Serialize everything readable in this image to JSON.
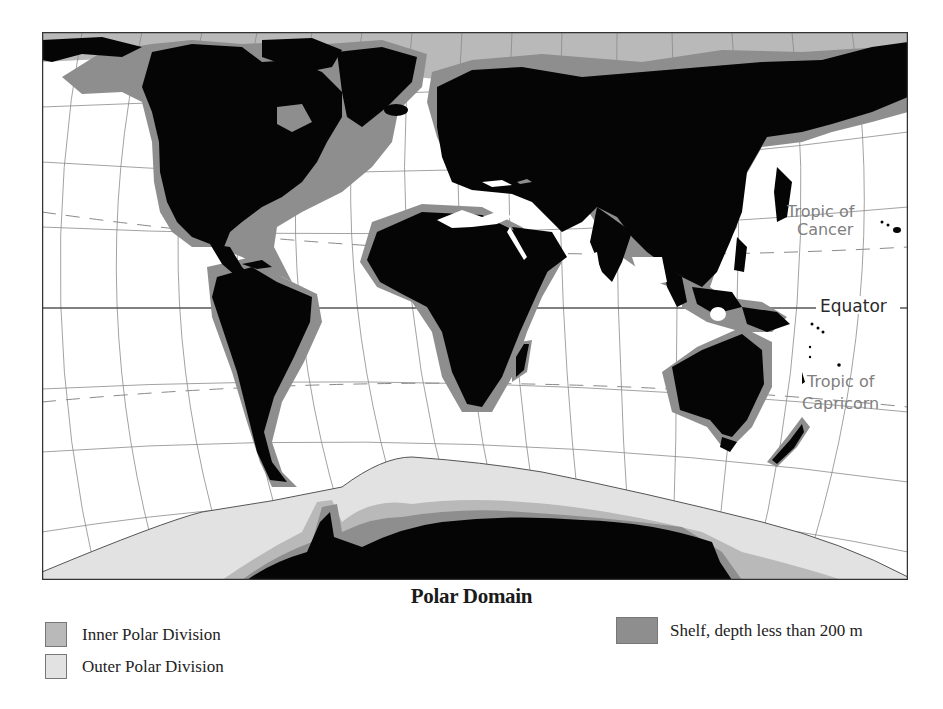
{
  "title": "Polar Domain",
  "map": {
    "labels": {
      "tropic_cancer_line1": "Tropic of",
      "tropic_cancer_line2": "Cancer",
      "equator": "Equator",
      "tropic_capricorn_line1": "Tropic of",
      "tropic_capricorn_line2": "Capricorn"
    },
    "colors": {
      "land": "#050505",
      "shelf": "#8e8e8e",
      "inner_polar": "#b9b9b9",
      "outer_polar": "#e2e2e2",
      "ocean": "#ffffff",
      "graticule": "#8a8a8a",
      "label_gray": "#808080",
      "label_dark": "#2a2a2a"
    }
  },
  "legend": {
    "items": [
      {
        "label": "Inner Polar Division",
        "color": "#b9b9b9"
      },
      {
        "label": "Outer Polar Division",
        "color": "#e2e2e2"
      },
      {
        "label": "Shelf, depth less than 200 m",
        "color": "#8e8e8e"
      }
    ]
  }
}
